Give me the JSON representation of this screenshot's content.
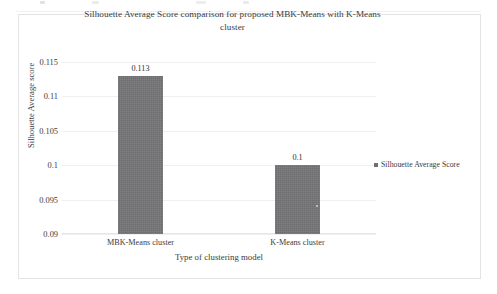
{
  "chart_data": {
    "type": "bar",
    "title": "Silhouette Average Score comparison for proposed MBK-Means with K-Means cluster",
    "title_line1": "Silhouette Average Score comparison for proposed MBK-Means with K-Means",
    "title_line2": "cluster",
    "categories": [
      "MBK-Means cluster",
      "K-Means cluster"
    ],
    "values": [
      0.113,
      0.1
    ],
    "value_labels": [
      "0.113",
      "0.1"
    ],
    "series": [
      {
        "name": "Silhouette Average Score",
        "values": [
          0.113,
          0.1
        ]
      }
    ],
    "xlabel": "Type of clustering model",
    "ylabel": "Silhouette Average score",
    "ylim": [
      0.09,
      0.115
    ],
    "ytick_values": [
      0.115,
      0.11,
      0.105,
      0.1,
      0.095,
      0.09
    ],
    "ytick_labels": [
      "0.115",
      "0.11",
      "0.105",
      "0.1",
      "0.095",
      "0.09"
    ],
    "grid": true,
    "legend_position": "right",
    "legend_entries": [
      "Silhouette Average Score"
    ],
    "bar_color": "#757577",
    "gridline_color": "#efeff1",
    "text_color": "#3b3b3b",
    "frame_color": "#e3e3e5"
  }
}
